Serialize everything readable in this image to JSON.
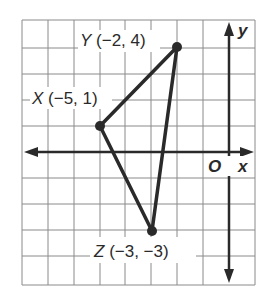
{
  "diagram": {
    "type": "coordinate-plane-triangle",
    "axes": {
      "x_label": "x",
      "y_label": "y",
      "origin_label": "O"
    },
    "grid": {
      "x_min": -8,
      "x_max": 1,
      "y_min": -5,
      "y_max": 5,
      "unit_px": 26,
      "origin_px": [
        229,
        152
      ]
    },
    "points": [
      {
        "name": "X",
        "coords": "(−5, 1)",
        "x": -5,
        "y": 1
      },
      {
        "name": "Y",
        "coords": "(−2, 4)",
        "x": -2,
        "y": 4
      },
      {
        "name": "Z",
        "coords": "(−3, −3)",
        "x": -3,
        "y": -3
      }
    ],
    "colors": {
      "grid": "#8a8a8a",
      "axis": "#2a2a2a",
      "triangle": "#2a2a2a"
    }
  }
}
